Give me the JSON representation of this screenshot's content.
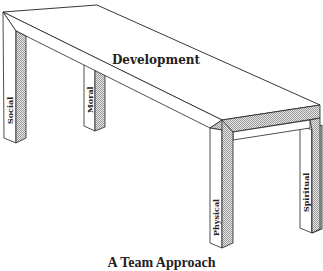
{
  "diagram": {
    "title_on_tabletop": "Development",
    "legs": [
      {
        "label": "Social"
      },
      {
        "label": "Moral"
      },
      {
        "label": "Physical"
      },
      {
        "label": "Spiritual"
      }
    ],
    "caption": "A Team Approach",
    "colors": {
      "line": "#222222",
      "shade": "#bdbdbd",
      "background": "#ffffff"
    }
  }
}
